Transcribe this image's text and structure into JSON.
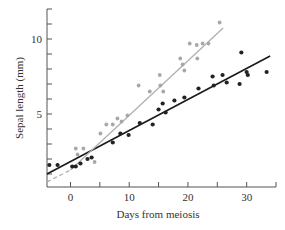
{
  "chart_data": {
    "type": "scatter",
    "title": "",
    "xlabel": "Days from meiosis",
    "ylabel": "Sepal length (mm)",
    "xlim": [
      -4,
      35
    ],
    "ylim": [
      0,
      12
    ],
    "x_major_ticks": [
      0,
      10,
      20,
      30
    ],
    "x_minor_ticks": [
      5,
      15,
      25,
      35
    ],
    "y_major_ticks": [
      5,
      10
    ],
    "y_minor_ticks": [
      1,
      2,
      3,
      4,
      6,
      7,
      8,
      9,
      11,
      12
    ],
    "grid": false,
    "legend": null,
    "series": [
      {
        "name": "dark",
        "color": "#222222",
        "points": [
          [
            -3.6,
            1.6
          ],
          [
            -2.2,
            1.6
          ],
          [
            0.3,
            1.5
          ],
          [
            0.9,
            1.5
          ],
          [
            1.7,
            1.7
          ],
          [
            2.9,
            2.0
          ],
          [
            3.6,
            2.1
          ],
          [
            7.2,
            3.1
          ],
          [
            8.5,
            3.7
          ],
          [
            9.9,
            3.6
          ],
          [
            11.8,
            4.4
          ],
          [
            14.0,
            4.3
          ],
          [
            15.0,
            5.3
          ],
          [
            15.7,
            5.7
          ],
          [
            16.2,
            5.1
          ],
          [
            17.7,
            5.9
          ],
          [
            19.4,
            6.1
          ],
          [
            21.8,
            6.7
          ],
          [
            24.2,
            7.5
          ],
          [
            24.4,
            6.9
          ],
          [
            25.9,
            7.6
          ],
          [
            26.6,
            7.1
          ],
          [
            28.8,
            7.0
          ],
          [
            29.1,
            9.1
          ],
          [
            30.0,
            7.8
          ],
          [
            30.2,
            7.6
          ],
          [
            33.4,
            7.8
          ]
        ],
        "fit_line": {
          "x": [
            -4,
            34
          ],
          "y": [
            1.0,
            8.87
          ]
        }
      },
      {
        "name": "light",
        "color": "#a8a8a8",
        "points": [
          [
            0.9,
            2.7
          ],
          [
            2.2,
            2.7
          ],
          [
            1.2,
            2.3
          ],
          [
            4.1,
            1.8
          ],
          [
            5.1,
            3.7
          ],
          [
            6.1,
            4.3
          ],
          [
            7.2,
            4.3
          ],
          [
            8.0,
            4.7
          ],
          [
            8.7,
            4.5
          ],
          [
            9.7,
            4.9
          ],
          [
            11.6,
            6.9
          ],
          [
            13.5,
            6.5
          ],
          [
            15.2,
            7.6
          ],
          [
            15.3,
            6.9
          ],
          [
            15.8,
            6.5
          ],
          [
            18.7,
            8.7
          ],
          [
            19.1,
            8.3
          ],
          [
            19.4,
            7.9
          ],
          [
            20.3,
            9.7
          ],
          [
            21.5,
            9.6
          ],
          [
            22.5,
            9.7
          ],
          [
            23.5,
            9.7
          ],
          [
            21.6,
            8.7
          ],
          [
            25.4,
            11.1
          ]
        ],
        "fit_line": {
          "x": [
            0,
            26
          ],
          "y": [
            1.27,
            10.73
          ]
        },
        "fit_line_extrapolated": {
          "x": [
            -4,
            0
          ],
          "y": [
            0.47,
            1.27
          ],
          "style": "dashed"
        }
      }
    ]
  }
}
